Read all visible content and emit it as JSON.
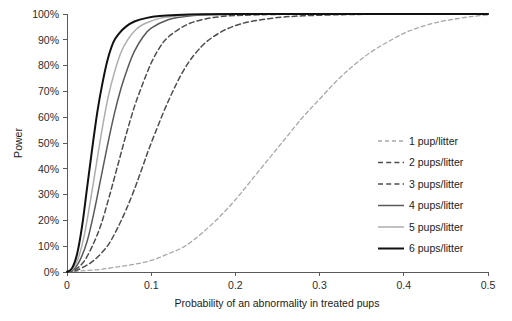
{
  "chart_data": {
    "type": "line",
    "title": "",
    "xlabel": "Probability of an abnormality in treated pups",
    "ylabel": "Power",
    "xlim": [
      0,
      0.5
    ],
    "ylim": [
      0,
      1
    ],
    "grid": false,
    "legend_position": "right-middle",
    "xticks": [
      "0",
      "0.1",
      "0.2",
      "0.3",
      "0.4",
      "0.5"
    ],
    "xtick_values": [
      0,
      0.1,
      0.2,
      0.3,
      0.4,
      0.5
    ],
    "yticks": [
      "0%",
      "10%",
      "20%",
      "30%",
      "40%",
      "50%",
      "60%",
      "70%",
      "80%",
      "90%",
      "100%"
    ],
    "ytick_values": [
      0,
      0.1,
      0.2,
      0.3,
      0.4,
      0.5,
      0.6,
      0.7,
      0.8,
      0.9,
      1.0
    ],
    "series": [
      {
        "name": "1 pup/litter",
        "color": "#a8a8a8",
        "style": "dashed",
        "width": 1.3,
        "x": [
          0,
          0.02,
          0.04,
          0.06,
          0.08,
          0.1,
          0.12,
          0.14,
          0.16,
          0.18,
          0.2,
          0.22,
          0.24,
          0.26,
          0.28,
          0.3,
          0.32,
          0.34,
          0.36,
          0.38,
          0.4,
          0.42,
          0.44,
          0.46,
          0.48,
          0.5
        ],
        "y": [
          0.0,
          0.005,
          0.01,
          0.02,
          0.03,
          0.045,
          0.07,
          0.1,
          0.15,
          0.21,
          0.28,
          0.36,
          0.44,
          0.52,
          0.6,
          0.67,
          0.74,
          0.8,
          0.85,
          0.89,
          0.925,
          0.95,
          0.968,
          0.98,
          0.99,
          0.996
        ]
      },
      {
        "name": "2 pups/litter",
        "color": "#4d4d4d",
        "style": "dashed",
        "width": 1.5,
        "x": [
          0,
          0.01,
          0.02,
          0.03,
          0.04,
          0.05,
          0.06,
          0.07,
          0.08,
          0.09,
          0.1,
          0.12,
          0.14,
          0.16,
          0.18,
          0.2,
          0.22,
          0.25,
          0.28,
          0.32,
          0.36,
          0.4,
          0.45,
          0.5
        ],
        "y": [
          0.0,
          0.005,
          0.02,
          0.04,
          0.07,
          0.11,
          0.17,
          0.24,
          0.32,
          0.41,
          0.5,
          0.66,
          0.79,
          0.875,
          0.925,
          0.955,
          0.972,
          0.986,
          0.993,
          0.997,
          0.999,
          1.0,
          1.0,
          1.0
        ]
      },
      {
        "name": "3 pups/litter",
        "color": "#4d4d4d",
        "style": "dashed",
        "width": 1.5,
        "x": [
          0,
          0.01,
          0.02,
          0.03,
          0.04,
          0.05,
          0.06,
          0.07,
          0.08,
          0.09,
          0.1,
          0.11,
          0.12,
          0.14,
          0.16,
          0.18,
          0.2,
          0.24,
          0.28,
          0.34,
          0.4,
          0.5
        ],
        "y": [
          0.0,
          0.01,
          0.04,
          0.1,
          0.18,
          0.29,
          0.41,
          0.53,
          0.64,
          0.73,
          0.81,
          0.87,
          0.91,
          0.955,
          0.978,
          0.989,
          0.994,
          0.998,
          0.999,
          1.0,
          1.0,
          1.0
        ]
      },
      {
        "name": "4 pups/litter",
        "color": "#595959",
        "style": "solid",
        "width": 1.5,
        "x": [
          0,
          0.008,
          0.016,
          0.024,
          0.032,
          0.04,
          0.048,
          0.056,
          0.064,
          0.072,
          0.08,
          0.09,
          0.1,
          0.12,
          0.14,
          0.16,
          0.2,
          0.25,
          0.3,
          0.4,
          0.5
        ],
        "y": [
          0.0,
          0.01,
          0.05,
          0.12,
          0.23,
          0.36,
          0.49,
          0.61,
          0.71,
          0.79,
          0.855,
          0.91,
          0.945,
          0.978,
          0.99,
          0.996,
          0.999,
          1.0,
          1.0,
          1.0,
          1.0
        ]
      },
      {
        "name": "5 pups/litter",
        "color": "#adadad",
        "style": "solid",
        "width": 1.5,
        "x": [
          0,
          0.007,
          0.014,
          0.021,
          0.028,
          0.035,
          0.042,
          0.049,
          0.056,
          0.064,
          0.072,
          0.082,
          0.092,
          0.11,
          0.13,
          0.15,
          0.18,
          0.22,
          0.28,
          0.36,
          0.5
        ],
        "y": [
          0.0,
          0.012,
          0.06,
          0.15,
          0.28,
          0.42,
          0.56,
          0.68,
          0.77,
          0.85,
          0.9,
          0.94,
          0.962,
          0.983,
          0.992,
          0.996,
          0.999,
          1.0,
          1.0,
          1.0,
          1.0
        ]
      },
      {
        "name": "6 pups/litter",
        "color": "#111111",
        "style": "solid",
        "width": 2.0,
        "x": [
          0,
          0.006,
          0.012,
          0.018,
          0.024,
          0.03,
          0.036,
          0.042,
          0.048,
          0.055,
          0.062,
          0.07,
          0.08,
          0.095,
          0.11,
          0.13,
          0.16,
          0.2,
          0.26,
          0.34,
          0.5
        ],
        "y": [
          0.0,
          0.015,
          0.07,
          0.18,
          0.33,
          0.48,
          0.62,
          0.73,
          0.82,
          0.89,
          0.925,
          0.951,
          0.971,
          0.985,
          0.992,
          0.996,
          0.999,
          1.0,
          1.0,
          1.0,
          1.0
        ]
      }
    ]
  },
  "legend": {
    "entries": [
      {
        "label": "1 pup/litter"
      },
      {
        "label": "2 pups/litter"
      },
      {
        "label": "3 pups/litter"
      },
      {
        "label": "4 pups/litter"
      },
      {
        "label": "5 pups/litter"
      },
      {
        "label": "6 pups/litter"
      }
    ]
  }
}
